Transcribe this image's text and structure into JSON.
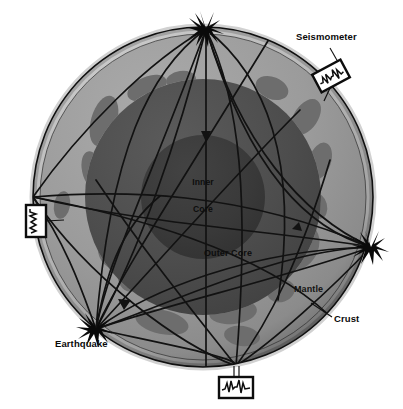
{
  "figure": {
    "background_color": "#ffffff"
  },
  "earth": {
    "center_x": 203,
    "center_y": 197,
    "radius": 170,
    "layers": [
      {
        "name": "Crust",
        "label": "Crust",
        "color": "#b9b9b9",
        "outer_radius": 170,
        "inner_radius": 163
      },
      {
        "name": "Mantle",
        "label": "Mantle",
        "color": "#9a9a9a",
        "outer_radius": 163,
        "inner_radius": 118
      },
      {
        "name": "Outer Core",
        "label": "Outer Core",
        "color": "#4f4f4f",
        "outer_radius": 118,
        "inner_radius": 62
      },
      {
        "name": "Inner Core",
        "label": "Inner Core",
        "color": "#3a3a3a",
        "outer_radius": 62,
        "inner_radius": 0
      }
    ],
    "continent_color": "#6e6e6e",
    "outline_color": "#1a1a1a"
  },
  "labels": {
    "seismometer": "Seismometer",
    "earthquake": "Earthquake",
    "crust": "Crust",
    "mantle": "Mantle",
    "inner_core_line1": "Inner",
    "inner_core_line2": "Core",
    "outer_core": "Outer Core"
  },
  "markers": {
    "earthquake_source": {
      "name": "earthquake-epicenter",
      "x": 96,
      "y": 329,
      "glyph": "starburst"
    },
    "receivers": [
      {
        "name": "receiver-top",
        "x": 206,
        "y": 29,
        "glyph": "starburst"
      },
      {
        "name": "receiver-right",
        "x": 371,
        "y": 247,
        "glyph": "starburst"
      }
    ]
  },
  "seismometers": [
    {
      "name": "seismometer-top-right",
      "x": 331,
      "y": 76,
      "width": 32,
      "height": 20,
      "rotation": -28,
      "trace": "seismogram"
    },
    {
      "name": "seismometer-left",
      "x": 36,
      "y": 221,
      "width": 20,
      "height": 32,
      "rotation": 0,
      "trace": "seismogram"
    },
    {
      "name": "seismometer-bottom",
      "x": 236,
      "y": 387,
      "width": 34,
      "height": 21,
      "rotation": 0,
      "trace": "seismogram"
    }
  ],
  "leader_lines": [
    {
      "name": "crust-leader",
      "from": [
        333,
        316
      ],
      "to": [
        313,
        305
      ]
    },
    {
      "name": "seismometer-leader",
      "from": [
        330,
        48
      ],
      "to": [
        338,
        62
      ]
    }
  ],
  "ray_paths": {
    "description": "Seismic wave ray paths from the earthquake focus refracting through mantle and core to seismometer stations",
    "count": 14,
    "stroke_color": "#121212",
    "arrowheads": 3
  }
}
